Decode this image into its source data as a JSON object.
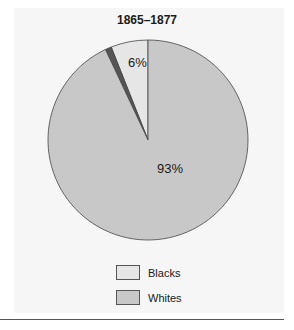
{
  "chart_data": {
    "type": "pie",
    "title": "1865–1877",
    "categories": [
      "Blacks",
      "Whites",
      "Other"
    ],
    "values": [
      6,
      93,
      1
    ],
    "labels": [
      "6%",
      "93%",
      ""
    ],
    "colors": [
      "#e6e6e6",
      "#c8c8c8",
      "#555555"
    ],
    "legend": [
      "Blacks",
      "Whites"
    ],
    "legend_position": "bottom"
  },
  "labels": {
    "blacks_pct": "6%",
    "whites_pct": "93%"
  },
  "legend": {
    "items": [
      {
        "label": "Blacks",
        "color": "#e6e6e6"
      },
      {
        "label": "Whites",
        "color": "#c8c8c8"
      }
    ]
  }
}
